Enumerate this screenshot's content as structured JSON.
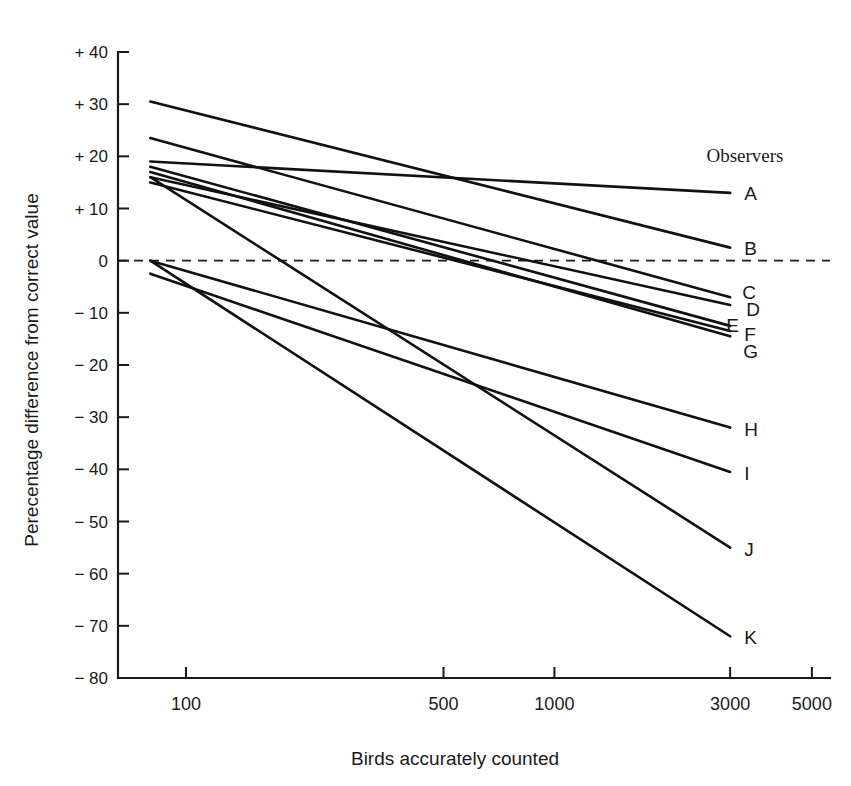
{
  "chart_data": {
    "type": "line",
    "title": "",
    "xlabel": "Birds accurately counted",
    "ylabel": "Perecentage difference from correct value",
    "xscale": "log",
    "xlim": [
      75,
      5600
    ],
    "ylim": [
      -80,
      40
    ],
    "grid": false,
    "legend_position": "right",
    "legend_title": "Observers",
    "zero_reference_line": 0,
    "xticks": [
      100,
      500,
      1000,
      3000,
      5000
    ],
    "xtick_labels": [
      "100",
      "500",
      "1000",
      "3000",
      "5000"
    ],
    "yticks": [
      40,
      30,
      20,
      10,
      0,
      -10,
      -20,
      -30,
      -40,
      -50,
      -60,
      -70,
      -80
    ],
    "ytick_labels": [
      "+ 40",
      "+ 30",
      "+ 20",
      "+ 10",
      "0",
      "− 10",
      "− 20",
      "− 30",
      "− 40",
      "− 50",
      "− 60",
      "− 70",
      "− 80"
    ],
    "x": [
      80,
      3000
    ],
    "series": [
      {
        "name": "A",
        "label": "A",
        "values": [
          19.0,
          13.0
        ]
      },
      {
        "name": "B",
        "label": "B",
        "values": [
          30.5,
          2.5
        ]
      },
      {
        "name": "C",
        "label": "C",
        "values": [
          23.5,
          -7.0
        ]
      },
      {
        "name": "D",
        "label": "D",
        "values": [
          16.0,
          -8.5
        ]
      },
      {
        "name": "E",
        "label": "E",
        "values": [
          18.0,
          -12.5
        ]
      },
      {
        "name": "F",
        "label": "F",
        "values": [
          15.0,
          -13.5
        ]
      },
      {
        "name": "G",
        "label": "G",
        "values": [
          17.0,
          -14.5
        ]
      },
      {
        "name": "H",
        "label": "H",
        "values": [
          0.0,
          -32.0
        ]
      },
      {
        "name": "I",
        "label": "I",
        "values": [
          -2.5,
          -40.5
        ]
      },
      {
        "name": "J",
        "label": "J",
        "values": [
          16.0,
          -55.0
        ]
      },
      {
        "name": "K",
        "label": "K",
        "values": [
          0.0,
          -72.0
        ]
      }
    ],
    "legend_label_offsets": [
      {
        "name": "A",
        "dx": 14,
        "dy": 7
      },
      {
        "name": "B",
        "dx": 14,
        "dy": 7
      },
      {
        "name": "C",
        "dx": 12,
        "dy": 2
      },
      {
        "name": "D",
        "dx": 16,
        "dy": 11
      },
      {
        "name": "E",
        "dx": -4,
        "dy": 6
      },
      {
        "name": "F",
        "dx": 14,
        "dy": 10
      },
      {
        "name": "G",
        "dx": 13,
        "dy": 22
      },
      {
        "name": "H",
        "dx": 14,
        "dy": 8
      },
      {
        "name": "I",
        "dx": 14,
        "dy": 8
      },
      {
        "name": "J",
        "dx": 14,
        "dy": 8
      },
      {
        "name": "K",
        "dx": 14,
        "dy": 8
      }
    ]
  },
  "figure": {
    "background_color": "#ffffff",
    "line_color": "#111111",
    "axis_color": "#1a1a1a"
  }
}
